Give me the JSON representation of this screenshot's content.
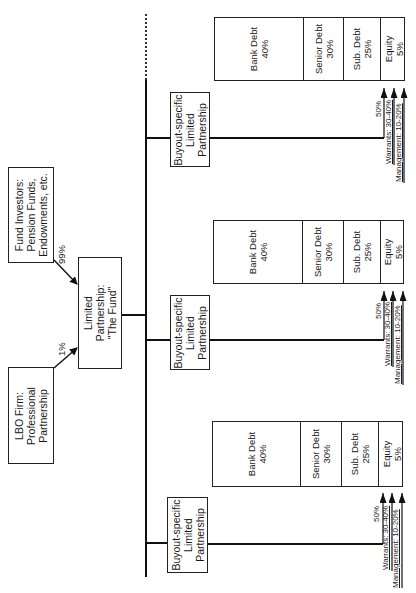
{
  "diagram": {
    "fund_investors": {
      "lines": [
        "Fund Investors:",
        "Pension Funds,",
        "Endowments, etc."
      ],
      "share": "99%"
    },
    "lbo_firm": {
      "lines": [
        "LBO Firm:",
        "Professional",
        "Partnership"
      ],
      "share": "1%"
    },
    "fund": {
      "lines": [
        "Limited",
        "Partnership:",
        "\"The Fund\""
      ]
    },
    "buyouts": [
      {
        "lines": [
          "Buyout-specific",
          "Limited",
          "Partnership"
        ],
        "capital_structure": [
          {
            "name": "Bank Debt",
            "pct": "40%"
          },
          {
            "name": "Senior Debt",
            "pct": "30%"
          },
          {
            "name": "Sub. Debt",
            "pct": "25%"
          },
          {
            "name": "Equity",
            "pct": "5%"
          }
        ],
        "equity_owners": [
          "50%",
          "Warrants: 30-40%",
          "Management: 10-20%"
        ]
      },
      {
        "lines": [
          "Buyout-specific",
          "Limited",
          "Partnership"
        ],
        "capital_structure": [
          {
            "name": "Bank Debt",
            "pct": "40%"
          },
          {
            "name": "Senior Debt",
            "pct": "30%"
          },
          {
            "name": "Sub. Debt",
            "pct": "25%"
          },
          {
            "name": "Equity",
            "pct": "5%"
          }
        ],
        "equity_owners": [
          "50%",
          "Warrants: 30-40%",
          "Management: 10-20%"
        ]
      },
      {
        "lines": [
          "Buyout-specific",
          "Limited",
          "Partnership"
        ],
        "capital_structure": [
          {
            "name": "Bank Debt",
            "pct": "40%"
          },
          {
            "name": "Senior Debt",
            "pct": "30%"
          },
          {
            "name": "Sub. Debt",
            "pct": "25%"
          },
          {
            "name": "Equity",
            "pct": "5%"
          }
        ],
        "equity_owners": [
          "50%",
          "Warrants: 30-40%",
          "Management: 10-20%"
        ]
      }
    ]
  }
}
